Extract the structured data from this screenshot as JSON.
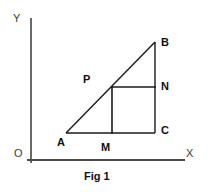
{
  "figure": {
    "caption": "Fig 1",
    "background_color": "#ffffff",
    "line_color": "#1a1a1a",
    "axis_color": "#6a6a6a",
    "label_color": "#101010",
    "axes": {
      "y_label": "Y",
      "x_label": "X",
      "origin_label": "O",
      "y_axis": {
        "x": 31,
        "y_top": 18,
        "y_bottom": 163
      },
      "x_axis": {
        "y": 160,
        "x_left": 27,
        "x_right": 185
      }
    },
    "points": [
      {
        "name": "A",
        "label": "A",
        "x": 66,
        "y": 133
      },
      {
        "name": "B",
        "label": "B",
        "x": 155,
        "y": 42
      },
      {
        "name": "C",
        "label": "C",
        "x": 155,
        "y": 133
      },
      {
        "name": "N",
        "label": "N",
        "x": 155,
        "y": 87
      },
      {
        "name": "P",
        "label": "P",
        "x": 112,
        "y": 87
      },
      {
        "name": "M",
        "label": "M",
        "x": 112,
        "y": 133
      }
    ],
    "segments": [
      {
        "name": "hypotenuse-AB",
        "x1": 66,
        "y1": 133,
        "x2": 155,
        "y2": 42
      },
      {
        "name": "vertical-BC",
        "x1": 155,
        "y1": 42,
        "x2": 155,
        "y2": 133
      },
      {
        "name": "base-AC",
        "x1": 66,
        "y1": 133,
        "x2": 155,
        "y2": 133
      },
      {
        "name": "square-top-PN",
        "x1": 112,
        "y1": 87,
        "x2": 155,
        "y2": 87
      },
      {
        "name": "square-left-PM",
        "x1": 112,
        "y1": 87,
        "x2": 112,
        "y2": 133
      }
    ]
  }
}
